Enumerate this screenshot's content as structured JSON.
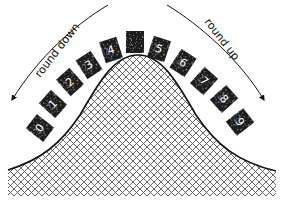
{
  "diagram": {
    "labels": {
      "left_arrow": "round down",
      "right_arrow": "round up"
    },
    "tiles": [
      {
        "label": "0",
        "x": 40,
        "y": 128,
        "angle": -52
      },
      {
        "label": "1",
        "x": 53,
        "y": 104,
        "angle": -48
      },
      {
        "label": "2",
        "x": 70,
        "y": 82,
        "angle": -42
      },
      {
        "label": "3",
        "x": 89,
        "y": 65,
        "angle": -33
      },
      {
        "label": "4",
        "x": 111,
        "y": 50,
        "angle": -18
      },
      {
        "label": "",
        "x": 135,
        "y": 42,
        "angle": 0
      },
      {
        "label": "5",
        "x": 159,
        "y": 49,
        "angle": 18
      },
      {
        "label": "6",
        "x": 183,
        "y": 63,
        "angle": 33
      },
      {
        "label": "7",
        "x": 204,
        "y": 81,
        "angle": 42
      },
      {
        "label": "8",
        "x": 224,
        "y": 99,
        "angle": 48
      },
      {
        "label": "9",
        "x": 240,
        "y": 122,
        "angle": 52
      }
    ],
    "colors": {
      "tile_fill": "#1a1a1a",
      "tile_text": "#ffffff",
      "curve": "#111111",
      "hatch": "#555555",
      "background": "#ffffff"
    }
  }
}
